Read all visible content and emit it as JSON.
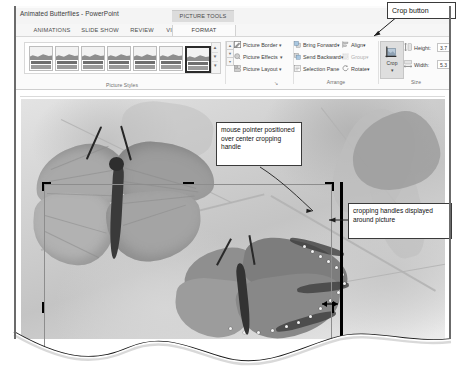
{
  "window": {
    "title": "Animated Butterflies - PowerPoint",
    "contextual_tab_group": "PICTURE TOOLS"
  },
  "ribbon": {
    "tabs": [
      {
        "label": "ANIMATIONS",
        "active": false
      },
      {
        "label": "SLIDE SHOW",
        "active": false
      },
      {
        "label": "REVIEW",
        "active": false
      },
      {
        "label": "VIEW",
        "active": false
      },
      {
        "label": "FORMAT",
        "active": true
      }
    ],
    "groups": [
      {
        "label": "Picture Styles"
      },
      {
        "label": "Arrange"
      },
      {
        "label": "Size"
      }
    ],
    "picture_styles": {
      "group_label": "Picture Styles",
      "thumb_count": 7,
      "selected_index": 6,
      "scroll_up": "▲",
      "scroll_down": "▼",
      "scroll_more": "▾"
    },
    "picture_commands": [
      {
        "label": "Picture Border",
        "icon": "pencil-border-icon",
        "has_dropdown": true,
        "caret": "▾"
      },
      {
        "label": "Picture Effects",
        "icon": "picture-effects-icon",
        "has_dropdown": true,
        "caret": "▾"
      },
      {
        "label": "Picture Layout",
        "icon": "picture-layout-icon",
        "has_dropdown": true,
        "caret": "▾"
      }
    ],
    "arrange": {
      "group_label": "Arrange",
      "commands": [
        {
          "label": "Bring Forward",
          "icon": "bring-forward-icon",
          "caret": "▾",
          "disabled": false
        },
        {
          "label": "Send Backward",
          "icon": "send-backward-icon",
          "caret": "▾",
          "disabled": false
        },
        {
          "label": "Selection Pane",
          "icon": "selection-pane-icon",
          "caret": "",
          "disabled": false
        },
        {
          "label": "Align",
          "icon": "align-icon",
          "caret": "▾",
          "disabled": false
        },
        {
          "label": "Group",
          "icon": "group-icon",
          "caret": "▾",
          "disabled": true
        },
        {
          "label": "Rotate",
          "icon": "rotate-icon",
          "caret": "▾",
          "disabled": false
        }
      ]
    },
    "size": {
      "group_label": "Size",
      "crop_button": {
        "label": "Crop",
        "icon": "crop-icon",
        "caret": "▾",
        "state": "active"
      },
      "height": {
        "label": "Height:",
        "icon": "shape-height-icon",
        "value": "3.7"
      },
      "width": {
        "label": "Width:",
        "icon": "shape-width-icon",
        "value": "5.3"
      }
    },
    "dialog_launcher": "↘"
  },
  "slide": {
    "picture_alt": "two butterflies photograph in crop mode"
  },
  "callouts": [
    {
      "id": "crop-button",
      "text": "Crop button"
    },
    {
      "id": "mouse-pointer",
      "text": "mouse pointer positioned over center cropping handle"
    },
    {
      "id": "cropping-handles",
      "text": "cropping handles displayed around picture"
    }
  ],
  "colors": {
    "callout_border": "#3a3a3a",
    "crop_handle": "#000000",
    "ribbon_background": "#fbfbfb",
    "active_button": "#dedede",
    "disabled_text": "#b0b0b0"
  }
}
